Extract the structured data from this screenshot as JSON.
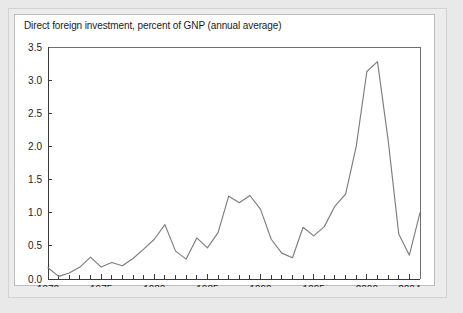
{
  "figure": {
    "title": "Direct foreign investment, percent of GNP (annual average)",
    "tick_2004_label": "2004"
  },
  "chart_data": {
    "type": "line",
    "title": "Direct foreign investment, percent of GNP (annual average)",
    "xlabel": "",
    "ylabel": "",
    "xlim": [
      1970,
      2005
    ],
    "ylim": [
      0.0,
      3.5
    ],
    "grid": false,
    "legend": null,
    "line_color": "#7d7d7d",
    "ytick_labels": [
      "0.0",
      "0.5",
      "1.0",
      "1.5",
      "2.0",
      "2.5",
      "3.0",
      "3.5"
    ],
    "ytick_values": [
      0.0,
      0.5,
      1.0,
      1.5,
      2.0,
      2.5,
      3.0,
      3.5
    ],
    "xtick_labels": [
      "1970",
      "1975",
      "1980",
      "1985",
      "1990",
      "1995",
      "2000",
      "2004"
    ],
    "xtick_values": [
      1970,
      1975,
      1980,
      1985,
      1990,
      1995,
      2000,
      2004
    ],
    "xtick_minor_values": [
      1971,
      1972,
      1973,
      1974,
      1976,
      1977,
      1978,
      1979,
      1981,
      1982,
      1983,
      1984,
      1986,
      1987,
      1988,
      1989,
      1991,
      1992,
      1993,
      1994,
      1996,
      1997,
      1998,
      1999,
      2001,
      2002,
      2003,
      2005
    ],
    "x": [
      1970,
      1971,
      1972,
      1973,
      1974,
      1975,
      1976,
      1977,
      1978,
      1979,
      1980,
      1981,
      1982,
      1983,
      1984,
      1985,
      1986,
      1987,
      1988,
      1989,
      1990,
      1991,
      1992,
      1993,
      1994,
      1995,
      1996,
      1997,
      1998,
      1999,
      2000,
      2001,
      2002,
      2003,
      2004,
      2005
    ],
    "values": [
      0.17,
      0.04,
      0.09,
      0.18,
      0.33,
      0.18,
      0.25,
      0.2,
      0.31,
      0.45,
      0.6,
      0.82,
      0.42,
      0.3,
      0.62,
      0.47,
      0.7,
      1.25,
      1.15,
      1.26,
      1.05,
      0.6,
      0.39,
      0.32,
      0.78,
      0.65,
      0.79,
      1.1,
      1.28,
      2.0,
      3.13,
      3.28,
      2.1,
      0.68,
      0.36,
      1.0
    ],
    "series": [
      {
        "name": "Direct foreign investment, percent of GNP",
        "values": [
          0.17,
          0.04,
          0.09,
          0.18,
          0.33,
          0.18,
          0.25,
          0.2,
          0.31,
          0.45,
          0.6,
          0.82,
          0.42,
          0.3,
          0.62,
          0.47,
          0.7,
          1.25,
          1.15,
          1.26,
          1.05,
          0.6,
          0.39,
          0.32,
          0.78,
          0.65,
          0.79,
          1.1,
          1.28,
          2.0,
          3.13,
          3.28,
          2.1,
          0.68,
          0.36,
          1.0
        ]
      }
    ]
  }
}
